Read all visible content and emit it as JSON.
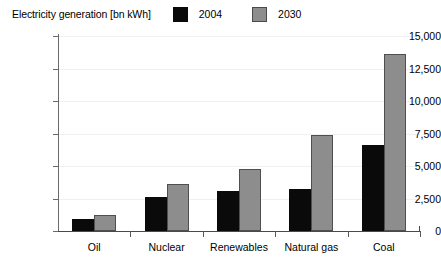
{
  "header": {
    "title": "Electricity generation [bn kWh]"
  },
  "legend": {
    "position": "top",
    "entries": [
      {
        "label": "2004",
        "color": "#0a0a0a",
        "swatch": "legend-swatch-2004"
      },
      {
        "label": "2030",
        "color": "#8d8d8d",
        "swatch": "legend-swatch-2030"
      }
    ]
  },
  "axes": {
    "y_ticks": [
      "15,000",
      "12,500",
      "10,000",
      "7,500",
      "5,000",
      "2,500",
      "0"
    ],
    "x_categories": [
      "Oil",
      "Nuclear",
      "Renewables",
      "Natural gas",
      "Coal"
    ]
  },
  "chart_data": {
    "type": "bar",
    "title": "Electricity generation [bn kWh]",
    "xlabel": "",
    "ylabel": "Electricity generation [bn kWh]",
    "ylim": [
      0,
      15000
    ],
    "ytick_step": 2500,
    "grid": true,
    "legend_position": "top",
    "categories": [
      "Oil",
      "Nuclear",
      "Renewables",
      "Natural gas",
      "Coal"
    ],
    "series": [
      {
        "name": "2004",
        "color": "#0a0a0a",
        "values": [
          950,
          2600,
          3100,
          3200,
          6650
        ]
      },
      {
        "name": "2030",
        "color": "#8d8d8d",
        "values": [
          1200,
          3600,
          4800,
          7400,
          13600
        ]
      }
    ]
  }
}
